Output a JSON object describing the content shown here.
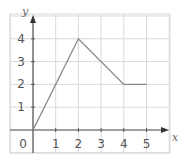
{
  "chart_data": {
    "type": "line",
    "title": "",
    "xlabel": "x",
    "ylabel": "y",
    "x": [
      0,
      2,
      4,
      5
    ],
    "series": [
      {
        "name": "line",
        "values": [
          0,
          4,
          2,
          2
        ]
      }
    ],
    "points": [
      [
        0,
        0
      ],
      [
        2,
        4
      ],
      [
        4,
        2
      ],
      [
        5,
        2
      ]
    ],
    "x_ticks": [
      "1",
      "2",
      "3",
      "4",
      "5"
    ],
    "y_ticks": [
      "1",
      "2",
      "3",
      "4"
    ],
    "origin_label": "0",
    "xlim": [
      0,
      6
    ],
    "ylim": [
      0,
      5
    ],
    "grid": true,
    "legend": "none"
  },
  "colors": {
    "grid": "#d9d9d9",
    "axis": "#555555",
    "line": "#888888"
  }
}
